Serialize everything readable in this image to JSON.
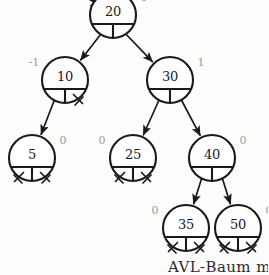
{
  "diagram": {
    "caption": "AVL-Baum mit",
    "colors": {
      "stroke": "#1a1a1a",
      "node_fill": "#ffffff",
      "balance_label": "#9a9a96",
      "background": "#fdfdfc"
    }
  },
  "tree": {
    "type": "binary-search-tree",
    "root_key": "20",
    "nodes": [
      {
        "id": "n20",
        "key": "20",
        "balance": "1",
        "bf_side": "right",
        "cx": 113,
        "cy": 15,
        "left": "n10",
        "right": "n30",
        "left_null": false,
        "right_null": false
      },
      {
        "id": "n10",
        "key": "10",
        "balance": "-1",
        "bf_side": "left",
        "cx": 65,
        "cy": 80,
        "left": "n5",
        "right": null,
        "left_null": false,
        "right_null": true
      },
      {
        "id": "n30",
        "key": "30",
        "balance": "1",
        "bf_side": "right",
        "cx": 170,
        "cy": 80,
        "left": "n25",
        "right": "n40",
        "left_null": false,
        "right_null": false
      },
      {
        "id": "n5",
        "key": "5",
        "balance": "0",
        "bf_side": "right",
        "cx": 32,
        "cy": 158,
        "left": null,
        "right": null,
        "left_null": true,
        "right_null": true
      },
      {
        "id": "n25",
        "key": "25",
        "balance": "0",
        "bf_side": "left",
        "cx": 133,
        "cy": 158,
        "left": null,
        "right": null,
        "left_null": true,
        "right_null": true
      },
      {
        "id": "n40",
        "key": "40",
        "balance": "0",
        "bf_side": "right",
        "cx": 212,
        "cy": 158,
        "left": "n35",
        "right": "n50",
        "left_null": false,
        "right_null": false
      },
      {
        "id": "n35",
        "key": "35",
        "balance": "0",
        "bf_side": "left",
        "cx": 186,
        "cy": 228,
        "left": null,
        "right": null,
        "left_null": true,
        "right_null": true
      },
      {
        "id": "n50",
        "key": "50",
        "balance": "0",
        "bf_side": "right",
        "cx": 238,
        "cy": 228,
        "left": null,
        "right": null,
        "left_null": true,
        "right_null": true
      }
    ],
    "edges": [
      {
        "from": "n20",
        "to": "n10",
        "side": "left"
      },
      {
        "from": "n20",
        "to": "n30",
        "side": "right"
      },
      {
        "from": "n10",
        "to": "n5",
        "side": "left"
      },
      {
        "from": "n30",
        "to": "n25",
        "side": "left"
      },
      {
        "from": "n30",
        "to": "n40",
        "side": "right"
      },
      {
        "from": "n40",
        "to": "n35",
        "side": "left"
      },
      {
        "from": "n40",
        "to": "n50",
        "side": "right"
      }
    ],
    "root_pointer": {
      "label": "",
      "from_x": 84,
      "from_y": -4,
      "to_x": 104,
      "to_y": 7
    }
  }
}
